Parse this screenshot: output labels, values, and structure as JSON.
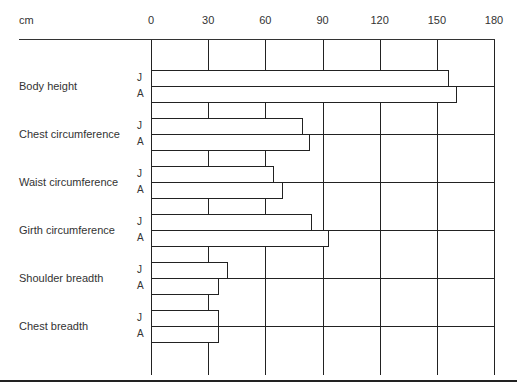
{
  "chart_data": {
    "type": "bar",
    "orientation": "horizontal",
    "title": "",
    "xlabel": "cm",
    "ylabel": "",
    "xlim": [
      0,
      180
    ],
    "x_ticks": [
      0,
      30,
      60,
      90,
      120,
      150,
      180
    ],
    "grid": true,
    "legend": null,
    "series_keys": [
      "J",
      "A"
    ],
    "categories": [
      "Body height",
      "Chest circumference",
      "Waist circumference",
      "Girth circumference",
      "Shoulder breadth",
      "Chest breadth"
    ],
    "series": [
      {
        "name": "J",
        "values": [
          156,
          79,
          64,
          84,
          40,
          35
        ]
      },
      {
        "name": "A",
        "values": [
          160,
          83,
          69,
          93,
          35,
          35
        ]
      }
    ]
  },
  "axis": {
    "unit_label": "cm",
    "ticks": [
      "0",
      "30",
      "60",
      "90",
      "120",
      "150",
      "180"
    ]
  },
  "rows": [
    {
      "label": "Body height",
      "j": "J",
      "a": "A"
    },
    {
      "label": "Chest circumference",
      "j": "J",
      "a": "A"
    },
    {
      "label": "Waist circumference",
      "j": "J",
      "a": "A"
    },
    {
      "label": "Girth circumference",
      "j": "J",
      "a": "A"
    },
    {
      "label": "Shoulder breadth",
      "j": "J",
      "a": "A"
    },
    {
      "label": "Chest breadth",
      "j": "J",
      "a": "A"
    }
  ]
}
